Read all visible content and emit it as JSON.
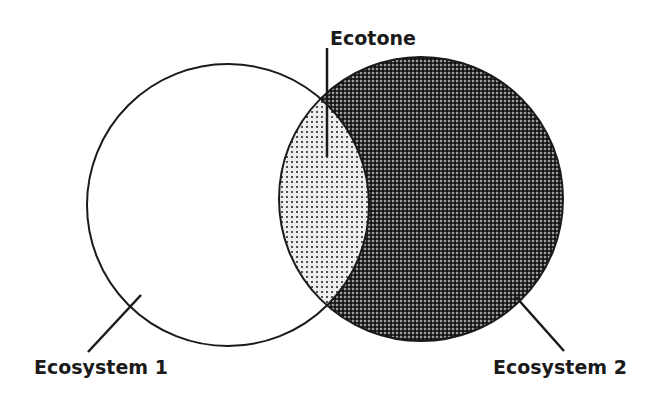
{
  "diagram": {
    "type": "venn",
    "labels": {
      "ecotone": "Ecotone",
      "ecosystem1": "Ecosystem 1",
      "ecosystem2": "Ecosystem 2"
    },
    "sets": [
      {
        "id": "ecosystem1",
        "label": "Ecosystem 1",
        "fill": "#ffffff",
        "pattern": "none",
        "center": [
          228,
          205
        ],
        "radius": 141
      },
      {
        "id": "ecosystem2",
        "label": "Ecosystem 2",
        "fill": "#3a3a3a",
        "pattern": "dense-checker",
        "center": [
          421,
          199
        ],
        "radius": 142
      }
    ],
    "overlap": {
      "id": "ecotone",
      "label": "Ecotone",
      "fill": "#d9d9d9",
      "pattern": "sparse-dots"
    },
    "colors": {
      "stroke": "#1a1a1a",
      "background": "#ffffff",
      "ecotone_base": "#e6e6e6",
      "ecotone_dot": "#4d4d4d",
      "ecosystem2_base": "#2b2b2b",
      "ecosystem2_dot": "#9a9a9a"
    }
  }
}
